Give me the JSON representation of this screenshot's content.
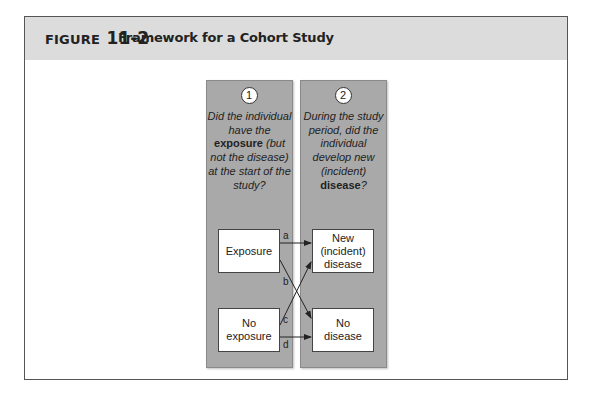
{
  "figure": {
    "label_keyword": "FIGURE",
    "label_number": "11-2",
    "title": "Framework for a Cohort Study"
  },
  "panels": [
    {
      "number": "1",
      "question_parts": [
        "Did the individual have the ",
        "exposure",
        " (but not the disease) at the start of the study?"
      ]
    },
    {
      "number": "2",
      "question_parts": [
        "During the study period, did the individual develop new (incident) ",
        "disease",
        "?"
      ]
    }
  ],
  "boxes": {
    "exposure": "Exposure",
    "no_exposure": "No exposure",
    "new_disease": "New (incident) disease",
    "no_disease": "No disease"
  },
  "arrows": {
    "a": "a",
    "b": "b",
    "c": "c",
    "d": "d"
  },
  "colors": {
    "header_bg": "#dcdcdc",
    "panel_bg": "#a9a9a9",
    "frame_border": "#555555"
  }
}
